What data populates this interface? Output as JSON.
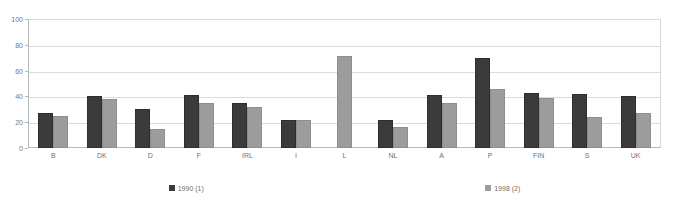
{
  "chart_data": {
    "type": "bar",
    "title": "",
    "subtitle": "",
    "xlabel": "",
    "ylabel": "",
    "ylim": [
      0,
      100
    ],
    "yticks": [
      0,
      20,
      40,
      60,
      80,
      100
    ],
    "grid": true,
    "legend_position": "bottom",
    "categories": [
      "B",
      "DK",
      "D",
      "F",
      "IRL",
      "I",
      "L",
      "NL",
      "A",
      "P",
      "FIN",
      "S",
      "UK"
    ],
    "series": [
      {
        "name": "1990 (1)",
        "color": "#3b3b3b",
        "values": [
          27,
          40,
          30,
          41,
          35,
          22,
          null,
          22,
          41,
          70,
          43,
          42,
          40
        ]
      },
      {
        "name": "1998 (2)",
        "color": "#9c9c9c",
        "values": [
          25,
          38,
          15,
          35,
          32,
          22,
          71,
          16,
          35,
          46,
          39,
          24,
          27
        ]
      }
    ]
  },
  "colors": {
    "background": "#ffffff",
    "gridline": "#dcdcdc",
    "axis": "#b9b9b9",
    "tick_text": "#777777",
    "label_text": "#6f6f6f"
  }
}
